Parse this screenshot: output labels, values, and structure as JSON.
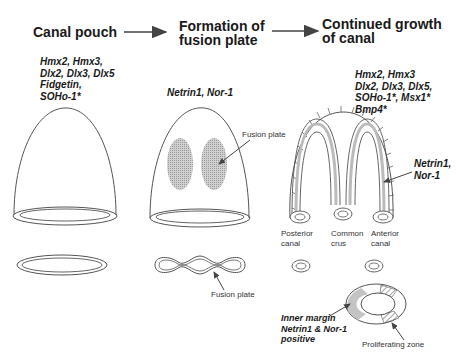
{
  "stages": [
    {
      "title_line1": "Canal pouch",
      "title_line2": ""
    },
    {
      "title_line1": "Formation of",
      "title_line2": "fusion plate"
    },
    {
      "title_line1": "Continued growth",
      "title_line2": "of canal"
    }
  ],
  "genes": {
    "canal_pouch": [
      "Hmx2, Hmx3,",
      "Dlx2, Dlx3, Dlx5",
      "Fidgetin,",
      "SOHo-1*"
    ],
    "fusion_plate": [
      "Netrin1, Nor-1"
    ],
    "continued_growth": [
      "Hmx2, Hmx3",
      "Dlx2, Dlx3, Dlx5,",
      "SOHo-1*, Msx1*",
      "Bmp4*"
    ],
    "canal_side": [
      "Netrin1,",
      "Nor-1"
    ]
  },
  "labels": {
    "fusion_plate_top": "Fusion plate",
    "fusion_plate_bottom": "Fusion plate",
    "posterior_canal": [
      "Posterior",
      "canal"
    ],
    "common_crus": [
      "Common",
      "crus"
    ],
    "anterior_canal": [
      "Anterior",
      "canal"
    ],
    "inner_margin": [
      "Inner margin",
      "Netrin1 & Nor-1",
      "positive"
    ],
    "proliferating_zone": "Proliferating zone"
  },
  "colors": {
    "line": "#555555",
    "fill_gray": "#bdbdbd",
    "text": "#1a1a1a"
  }
}
